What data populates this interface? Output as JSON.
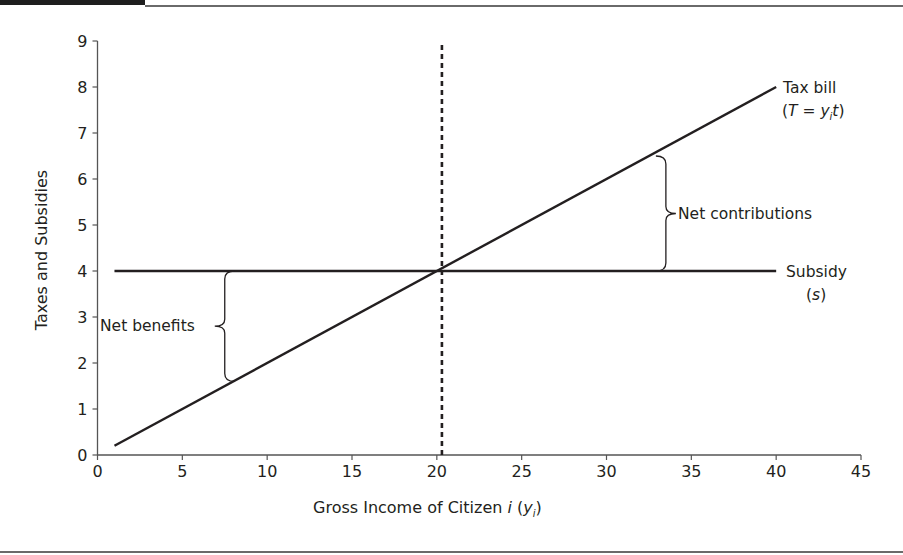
{
  "chart_data": {
    "type": "line",
    "title": "",
    "xlabel": "Gross Income of Citizen i (y_i)",
    "xlabel_parts": {
      "main": "Gross Income of Citizen ",
      "italic_i": "i",
      "open": " (",
      "y": "y",
      "sub": "i",
      "close": ")"
    },
    "ylabel": "Taxes and Subsidies",
    "xlim": [
      0,
      45
    ],
    "ylim": [
      0,
      9
    ],
    "x_ticks": [
      0,
      5,
      10,
      15,
      20,
      25,
      30,
      35,
      40,
      45
    ],
    "y_ticks": [
      0,
      1,
      2,
      3,
      4,
      5,
      6,
      7,
      8,
      9
    ],
    "grid": false,
    "series": [
      {
        "name": "Tax bill (T = y_i t)",
        "style": "solid",
        "x": [
          1,
          40
        ],
        "y": [
          0.2,
          8.0
        ]
      },
      {
        "name": "Subsidy (s)",
        "style": "solid",
        "x": [
          1,
          40
        ],
        "y": [
          4.0,
          4.0
        ]
      },
      {
        "name": "Break-even income",
        "style": "dotted-vertical",
        "x": [
          20.3,
          20.3
        ],
        "y": [
          0,
          9
        ]
      }
    ],
    "annotations": [
      {
        "text": "Net benefits",
        "type": "brace",
        "x": 7.5,
        "y_range": [
          1.6,
          4.0
        ]
      },
      {
        "text": "Net contributions",
        "type": "brace",
        "x": 33.5,
        "y_range": [
          4.0,
          6.5
        ]
      }
    ],
    "line_labels": {
      "tax_bill": {
        "line1": "Tax bill",
        "line2_open": "(",
        "T": "T",
        "eq": " = ",
        "y": "y",
        "sub": "i",
        "t": "t",
        "line2_close": ")"
      },
      "subsidy": {
        "line1": "Subsidy",
        "line2_open": "(",
        "s": "s",
        "line2_close": ")"
      }
    }
  },
  "colors": {
    "ink": "#231f20",
    "rule": "#6a6a6a",
    "bar": "#1e1e1e"
  }
}
